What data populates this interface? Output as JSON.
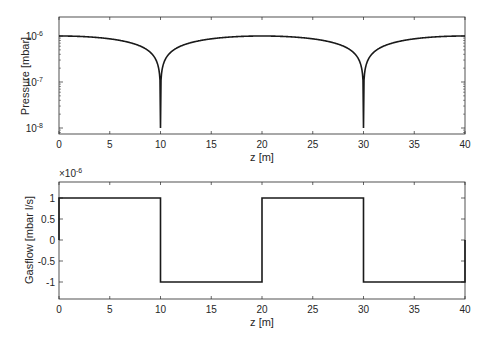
{
  "chart_data": [
    {
      "type": "line",
      "title": "",
      "xlabel": "z [m]",
      "ylabel": "Pressure [mbar]",
      "yscale": "log",
      "xlim": [
        0,
        40
      ],
      "ylim": [
        6e-09,
        2.5e-06
      ],
      "xticks": [
        0,
        5,
        10,
        15,
        20,
        25,
        30,
        35,
        40
      ],
      "yticks": [
        "10^-6",
        "10^-7",
        "10^-8"
      ],
      "grid": false,
      "series": [
        {
          "name": "Pressure",
          "x": [
            0,
            2,
            4,
            6,
            8,
            9,
            9.5,
            10,
            10.5,
            11,
            12,
            14,
            16,
            18,
            20,
            22,
            24,
            26,
            28,
            29,
            29.5,
            30,
            30.5,
            31,
            32,
            34,
            36,
            38,
            40
          ],
          "values": [
            1e-06,
            9e-07,
            7.5e-07,
            5.5e-07,
            3e-07,
            1.6e-07,
            8.5e-08,
            1e-08,
            8.5e-08,
            1.6e-07,
            3e-07,
            5.5e-07,
            7.5e-07,
            9e-07,
            1e-06,
            9e-07,
            7.5e-07,
            5.5e-07,
            3e-07,
            1.6e-07,
            8.5e-08,
            1e-08,
            8.5e-08,
            1.6e-07,
            3e-07,
            5.5e-07,
            7.5e-07,
            9e-07,
            1e-06
          ]
        }
      ]
    },
    {
      "type": "line",
      "title": "",
      "xlabel": "z [m]",
      "ylabel": "Gasflow [mbar l/s]",
      "y_exponent_label": "×10^-6",
      "xlim": [
        0,
        40
      ],
      "ylim": [
        -1.4,
        1.4
      ],
      "xticks": [
        0,
        5,
        10,
        15,
        20,
        25,
        30,
        35,
        40
      ],
      "yticks": [
        1,
        0.5,
        0,
        -0.5,
        -1
      ],
      "grid": false,
      "series": [
        {
          "name": "Gasflow",
          "x": [
            0,
            0,
            10,
            10,
            20,
            20,
            30,
            30,
            40,
            40
          ],
          "values": [
            0,
            1,
            1,
            -1,
            -1,
            1,
            1,
            -1,
            -1,
            0
          ]
        }
      ]
    }
  ],
  "labels": {
    "top_xlabel": "z [m]",
    "top_ylabel": "Pressure [mbar]",
    "bottom_xlabel": "z [m]",
    "bottom_ylabel": "Gasflow [mbar l/s]",
    "exp_base": "×10",
    "exp_power": "-6",
    "log_base": "10",
    "log_exps": [
      "-6",
      "-7",
      "-8"
    ],
    "xticks": [
      "0",
      "5",
      "10",
      "15",
      "20",
      "25",
      "30",
      "35",
      "40"
    ],
    "bottom_yticks": [
      "1",
      "0.5",
      "0",
      "-0.5",
      "-1"
    ]
  }
}
